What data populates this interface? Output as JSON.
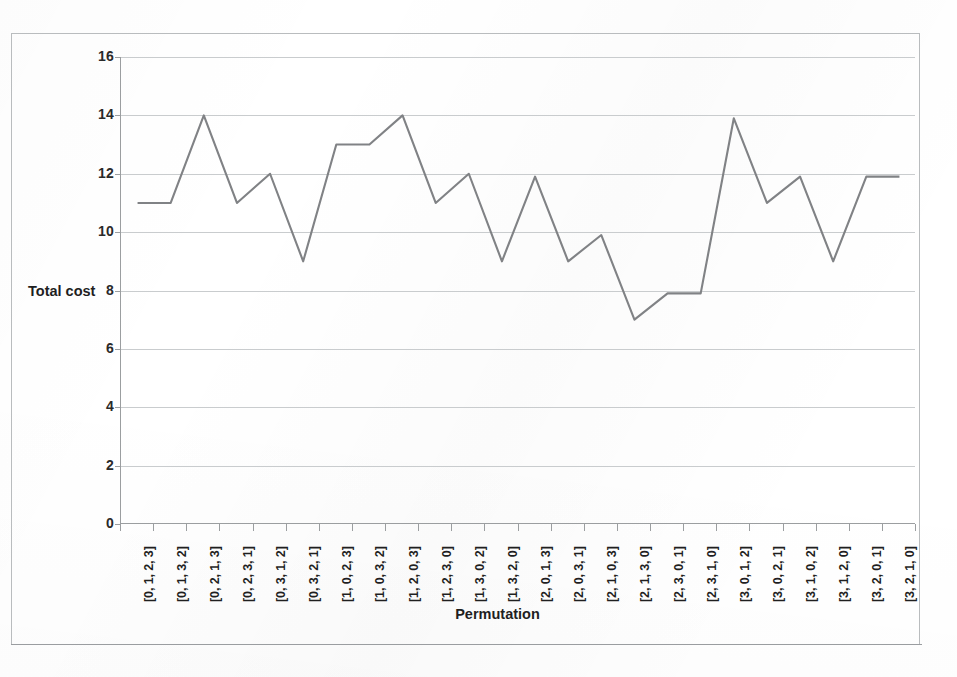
{
  "chart_data": {
    "type": "line",
    "title": "",
    "xlabel": "Permutation",
    "ylabel": "Total cost",
    "ylim": [
      0,
      16
    ],
    "ytick_step": 2,
    "yticks": [
      0,
      2,
      4,
      6,
      8,
      10,
      12,
      14,
      16
    ],
    "grid": true,
    "legend": false,
    "series_color": "#808285",
    "gridline_color": "#c9ccce",
    "axis_color": "#9b9ea0",
    "categories": [
      "[0, 1, 2, 3]",
      "[0, 1, 3, 2]",
      "[0, 2, 1, 3]",
      "[0, 2, 3, 1]",
      "[0, 3, 1, 2]",
      "[0, 3, 2, 1]",
      "[1, 0, 2, 3]",
      "[1, 0, 3, 2]",
      "[1, 2, 0, 3]",
      "[1, 2, 3, 0]",
      "[1, 3, 0, 2]",
      "[1, 3, 2, 0]",
      "[2, 0, 1, 3]",
      "[2, 0, 3, 1]",
      "[2, 1, 0, 3]",
      "[2, 1, 3, 0]",
      "[2, 3, 0, 1]",
      "[2, 3, 1, 0]",
      "[3, 0, 1, 2]",
      "[3, 0, 2, 1]",
      "[3, 1, 0, 2]",
      "[3, 1, 2, 0]",
      "[3, 2, 0, 1]",
      "[3, 2, 1, 0]"
    ],
    "values": [
      11,
      11,
      14,
      11,
      12,
      9,
      13,
      13,
      14,
      11,
      12,
      9,
      11.9,
      9,
      9.9,
      7,
      7.9,
      7.9,
      13.9,
      11,
      11.9,
      9,
      11.9,
      11.9
    ]
  }
}
